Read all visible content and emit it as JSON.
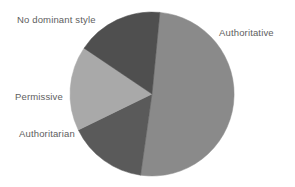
{
  "chart_data": {
    "type": "pie",
    "title": "",
    "categories": [
      "Authoritative",
      "Authoritarian",
      "Permissive",
      "No dominant style"
    ],
    "values": [
      51,
      15.5,
      16.5,
      17
    ],
    "units": "percent",
    "colors": [
      "#8a8a8a",
      "#5a5a5a",
      "#a9a9a9",
      "#4f4f4f"
    ],
    "start_angle_deg": 5.5,
    "direction": "clockwise",
    "legend": "none",
    "labels_position": "outside",
    "grid": false,
    "xlabel": "",
    "ylabel": "",
    "slices": [
      {
        "label": "Authoritative",
        "value": 51,
        "color": "#8a8a8a",
        "start_deg": 5.5,
        "end_deg": 188,
        "label_side": "right"
      },
      {
        "label": "Authoritarian",
        "value": 15.5,
        "color": "#5a5a5a",
        "start_deg": 188,
        "end_deg": 244,
        "label_side": "left"
      },
      {
        "label": "Permissive",
        "value": 16.5,
        "color": "#a9a9a9",
        "start_deg": 244,
        "end_deg": 304,
        "label_side": "left"
      },
      {
        "label": "No dominant style",
        "value": 17,
        "color": "#4f4f4f",
        "start_deg": 304,
        "end_deg": 365.5,
        "label_side": "left"
      }
    ]
  },
  "labels": {
    "no_dominant_style": "No dominant style",
    "authoritative": "Authoritative",
    "permissive": "Permissive",
    "authoritarian": "Authoritarian"
  },
  "figure": {
    "background": "#ffffff",
    "center_x": 152,
    "center_y": 94,
    "radius": 82
  }
}
